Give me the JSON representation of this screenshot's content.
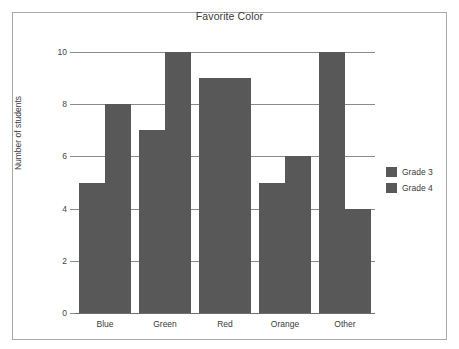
{
  "chart_data": {
    "type": "bar",
    "title": "Favorite Color",
    "xlabel": "",
    "ylabel": "Number of students",
    "categories": [
      "Blue",
      "Green",
      "Red",
      "Orange",
      "Other"
    ],
    "series": [
      {
        "name": "Grade 3",
        "values": [
          5,
          7,
          9,
          5,
          10
        ],
        "color": "#585858"
      },
      {
        "name": "Grade 4",
        "values": [
          8,
          10,
          9,
          6,
          4
        ],
        "color": "#585858"
      }
    ],
    "ylim": [
      0,
      10
    ],
    "ytick_labels": [
      "10",
      "8",
      "6",
      "4",
      "2",
      "0"
    ],
    "ytick_values": [
      10,
      8,
      6,
      4,
      2,
      0
    ],
    "grid": true,
    "legend_position": "right"
  },
  "legend": {
    "entries": [
      {
        "label": "Grade 3"
      },
      {
        "label": "Grade 4"
      }
    ]
  },
  "colors": {
    "bar": "#585858",
    "gridline": "#8a8a8a",
    "frame": "#a9a9a9",
    "text": "#3b3b3b"
  }
}
